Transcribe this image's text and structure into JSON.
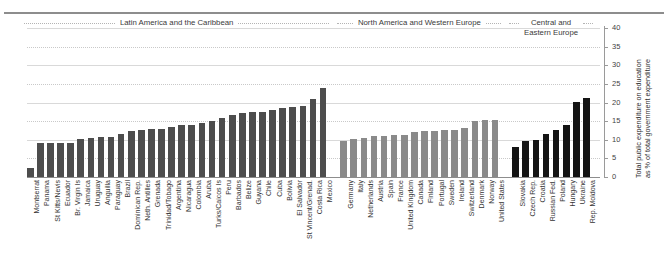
{
  "chart_data": {
    "type": "bar",
    "title": "",
    "subtitle": "",
    "xlabel": "",
    "ylabel": "Total public expenditure on education\nas % of total government expenditure",
    "ylim": [
      0,
      40
    ],
    "yticks": [
      0,
      5,
      10,
      15,
      20,
      25,
      30,
      35,
      40
    ],
    "ytick_labels": [
      "0",
      "5",
      "10",
      "15",
      "20",
      "25",
      "30",
      "35",
      "40"
    ],
    "grid": true,
    "legend": "none",
    "groups": [
      {
        "name": "Latin America and the Caribbean",
        "color": "#4d4d4d",
        "categories": [
          "Montserrat",
          "Panama",
          "St Kitts/Nevis",
          "Ecuador",
          "Br. Virgin Is",
          "Jamaica",
          "Uruguay",
          "Anguilla",
          "Paraguay",
          "Brazil",
          "Dominican Rep.",
          "Neth. Antilles",
          "Grenada",
          "Trinidad/Tobago",
          "Argentina",
          "Nicaragua",
          "Colombia",
          "Aruba",
          "Turks/Caicos Is",
          "Peru",
          "Barbados",
          "Belize",
          "Guyana",
          "Chile",
          "Cuba",
          "Bolivia",
          "El Salvador",
          "St Vincent/Grenad.",
          "Costa Rica",
          "Mexico"
        ],
        "values": [
          2.3,
          9.0,
          9.0,
          9.1,
          9.2,
          10.1,
          10.6,
          10.7,
          10.8,
          11.5,
          12.4,
          12.7,
          12.8,
          13.0,
          13.4,
          13.9,
          14.0,
          14.4,
          15.1,
          15.9,
          16.6,
          17.2,
          17.4,
          17.5,
          18.1,
          18.6,
          18.8,
          19.0,
          21.0,
          23.9
        ]
      },
      {
        "name": "North America and Western Europe",
        "color": "#8a8a8a",
        "categories": [
          "Germany",
          "Italy",
          "Netherlands",
          "Austria",
          "Spain",
          "France",
          "United Kingdom",
          "Canada",
          "Finland",
          "Portugal",
          "Sweden",
          "Ireland",
          "Switzerland",
          "Denmark",
          "Norway",
          "United States"
        ],
        "values": [
          9.7,
          10.3,
          10.6,
          10.9,
          11.1,
          11.2,
          11.3,
          12.2,
          12.3,
          12.4,
          12.5,
          12.7,
          13.1,
          15.0,
          15.4,
          15.4
        ]
      },
      {
        "name": "Central and\nEastern Europe",
        "color": "#141414",
        "categories": [
          "Slovakia",
          "Czech Rep.",
          "Croatia",
          "Russian Fed.",
          "Poland",
          "Hungary",
          "Ukraine",
          "Rep. Moldova"
        ],
        "values": [
          8.0,
          9.7,
          10.0,
          11.6,
          12.6,
          14.0,
          20.2,
          21.2
        ]
      }
    ]
  }
}
